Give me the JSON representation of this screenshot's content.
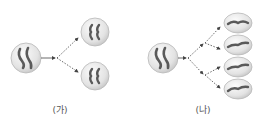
{
  "diagrams": [
    {
      "id": "ga",
      "label": "(가)",
      "description": "Mitosis: one cell with 2 chromosomes divides into 2 cells each with 2 chromosomes"
    },
    {
      "id": "na",
      "label": "(나)",
      "description": "Meiosis: one cell with 2 chromosomes divides twice into 4 cells each with 1 chromosome"
    }
  ],
  "colors": {
    "cell_fill": "#e6e6e6",
    "cell_edge": "#b5b5b5",
    "chromosome": "#5a5a5a",
    "arrow": "#444444"
  }
}
